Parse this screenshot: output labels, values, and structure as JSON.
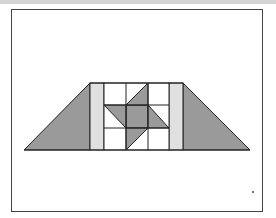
{
  "figure": {
    "colors": {
      "background": "#ffffff",
      "stroke": "#222222",
      "dark_fill": "#9a9a9a",
      "light_fill": "#e0e0e0",
      "frame": "#444444",
      "topbar": "#d4d4d4"
    },
    "trapezoid": {
      "top_y": 83,
      "bottom_y": 150,
      "bottom_left_x": 24,
      "top_left_x": 90,
      "top_right_x": 183,
      "bottom_right_x": 250
    },
    "grid": {
      "x_lines": [
        90,
        104,
        126,
        148,
        169,
        183
      ],
      "y_lines": [
        83,
        105,
        128,
        150
      ]
    }
  }
}
